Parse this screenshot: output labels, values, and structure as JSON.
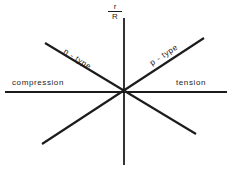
{
  "figure": {
    "background_color": "#ffffff",
    "line_color": "#1c1c1c",
    "text_color": "#1c1c1c"
  },
  "axes": {
    "vertical_label": {
      "numerator": "r",
      "denominator": "R",
      "full": "r/R"
    }
  },
  "labels": {
    "n_type": "n - type",
    "p_type": "p - type",
    "compression": "compression",
    "tension": "tension"
  },
  "chart_data": {
    "type": "line",
    "title": "",
    "subtitle": "",
    "xlabel": "",
    "ylabel": "r/R",
    "grid": false,
    "legend_position": "inline-annotations",
    "origin": {
      "x": 124,
      "y": 92
    },
    "xlim": [
      5,
      227
    ],
    "ylim": [
      18,
      165
    ],
    "annotations": [
      {
        "text": "r/R",
        "x": 115,
        "y": 10
      },
      {
        "text": "n - type",
        "x": 80,
        "y": 56
      },
      {
        "text": "p - type",
        "x": 166,
        "y": 56
      },
      {
        "text": "compression",
        "x": 40,
        "y": 83
      },
      {
        "text": "tension",
        "x": 190,
        "y": 83
      }
    ],
    "series": [
      {
        "name": "vertical-axis",
        "kind": "axis",
        "points": [
          {
            "x": 124,
            "y": 18
          },
          {
            "x": 124,
            "y": 165
          }
        ]
      },
      {
        "name": "horizontal-axis",
        "kind": "axis",
        "points": [
          {
            "x": 5,
            "y": 92
          },
          {
            "x": 227,
            "y": 92
          }
        ]
      },
      {
        "name": "p - type",
        "kind": "line",
        "slope_sign": "positive",
        "points": [
          {
            "x": 42,
            "y": 144
          },
          {
            "x": 204,
            "y": 38
          }
        ]
      },
      {
        "name": "n - type",
        "kind": "line",
        "slope_sign": "negative",
        "points": [
          {
            "x": 45,
            "y": 43
          },
          {
            "x": 196,
            "y": 134
          }
        ]
      }
    ]
  }
}
